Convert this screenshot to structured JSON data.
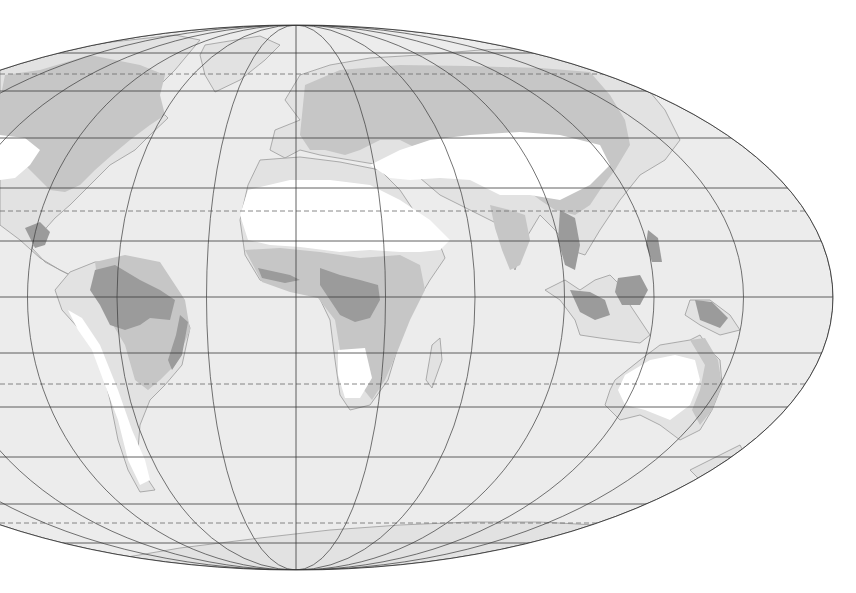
{
  "map": {
    "type": "world-biome-map",
    "projection": "elliptical (Hammer/Aitoff-like), central meridian ~15°E",
    "canvas": {
      "width": 856,
      "height": 593,
      "background": "#ffffff"
    },
    "ellipse": {
      "cx": 296,
      "cy": 297.5,
      "rx": 537,
      "ry": 272.5
    },
    "colors": {
      "ocean": "#ececec",
      "land": "#e2e2e2",
      "coast": "#9a9a9a",
      "forest": "#c6c6c6",
      "rainforest": "#9b9b9b",
      "desert": "#ffffff",
      "grid": "#3a3a3a",
      "dashed": "#6a6a6a"
    },
    "graticule": {
      "meridian_step_px": 89.5,
      "meridian_count_each_side": 6,
      "parallels_solid_y": [
        53,
        91,
        138,
        188,
        241,
        297,
        353,
        407,
        457,
        504,
        543
      ],
      "parallels_dashed_y": [
        74,
        211,
        384,
        523
      ],
      "parallel_labels": {
        "74": "Arctic Circle",
        "211": "Tropic of Cancer",
        "297": "Equator",
        "384": "Tropic of Capricorn",
        "523": "Antarctic Circle"
      }
    },
    "legend_classes": [
      "desert",
      "forest",
      "rainforest",
      "other land"
    ]
  },
  "regions": {
    "land": [
      {
        "name": "north-america",
        "d": "M0,60 L60,48 L130,40 L175,35 L200,40 L175,70 L150,95 L160,110 L168,118 L150,135 L135,150 L110,165 L95,180 L70,205 L55,218 L40,235 L32,248 L45,262 L60,270 L80,280 L60,270 L40,258 L20,240 L0,225 Z"
      },
      {
        "name": "greenland",
        "d": "M205,45 L260,36 L280,45 L265,60 L240,80 L215,92 L205,75 L200,55 Z"
      },
      {
        "name": "south-america",
        "d": "M70,272 L95,262 L118,262 L150,285 L180,300 L190,328 L182,365 L165,385 L150,400 L140,425 L138,450 L145,475 L155,490 L140,492 L128,470 L118,440 L110,400 L100,360 L80,330 L62,310 L55,290 Z"
      },
      {
        "name": "europe-asia",
        "d": "M300,120 L285,100 L300,75 L330,65 L370,58 L420,55 L480,50 L540,48 L600,60 L640,80 L665,110 L680,140 L665,160 L640,175 L620,200 L600,230 L585,255 L570,250 L555,230 L540,215 L525,240 L515,270 L505,250 L500,225 L480,215 L460,205 L440,195 L420,178 L400,170 L380,165 L350,160 L320,155 L300,150 L285,158 L270,150 L275,130 Z"
      },
      {
        "name": "africa",
        "d": "M260,160 L300,157 L340,162 L380,170 L400,190 L420,220 L440,245 L445,258 L430,280 L415,305 L400,340 L388,380 L370,405 L350,410 L340,395 L335,360 L330,320 L318,295 L290,290 L260,280 L245,255 L240,220 L248,185 Z"
      },
      {
        "name": "madagascar",
        "d": "M432,345 L440,338 L442,360 L432,388 L426,380 Z"
      },
      {
        "name": "southeast-asia-islands",
        "d": "M545,290 L560,300 L575,320 L580,335 L600,338 L615,340 L640,343 L650,335 L640,320 L630,305 L625,290 L610,275 L595,280 L580,290 L565,280 Z"
      },
      {
        "name": "new-guinea",
        "d": "M690,300 L710,300 L730,315 L740,330 L720,335 L700,325 L685,315 Z"
      },
      {
        "name": "australia",
        "d": "M615,380 L640,360 L660,345 L690,340 L700,335 L710,350 L720,360 L722,385 L712,410 L700,430 L680,440 L660,425 L640,415 L620,420 L605,405 L610,390 Z"
      },
      {
        "name": "new-zealand",
        "d": "M690,470 L720,455 L740,445 L745,455 L728,465 L700,480 Z"
      },
      {
        "name": "antarctica",
        "d": "M110,560 L180,548 L260,538 L330,530 L400,525 L470,522 L540,522 L595,525 L560,545 L470,562 L380,570 L300,572 L220,570 L160,566 Z"
      }
    ],
    "forest": [
      {
        "name": "north-america-boreal-temperate",
        "d": "M5,75 L40,70 L90,55 L140,65 L165,75 L160,95 L165,115 L150,125 L130,140 L112,155 L95,170 L80,185 L65,192 L50,190 L35,175 L20,160 L0,150 L0,100 Z"
      },
      {
        "name": "eurasia-forest",
        "d": "M305,85 L340,70 L400,65 L470,66 L540,68 L590,72 L610,95 L625,120 L630,145 L615,170 L600,190 L590,205 L575,215 L555,210 L540,200 L520,185 L500,175 L480,165 L460,160 L440,160 L420,150 L400,140 L380,140 L360,150 L345,155 L325,150 L310,150 L300,135 Z"
      },
      {
        "name": "africa-savanna",
        "d": "M245,250 L280,248 L320,252 L360,258 L400,255 L420,265 L425,290 L410,320 L398,350 L385,380 L372,400 L356,380 L340,350 L335,320 L318,298 L290,292 L262,282 Z"
      },
      {
        "name": "south-america-forest",
        "d": "M95,262 L125,255 L160,262 L185,300 L190,330 L175,365 L160,380 L148,390 L135,380 L125,345 L110,320 L100,300 Z"
      },
      {
        "name": "india-forest",
        "d": "M490,205 L510,210 L525,215 L530,240 L520,265 L510,270 L502,250 L495,228 Z"
      },
      {
        "name": "australia-rim-forest",
        "d": "M690,340 L705,338 L718,360 L722,385 L712,410 L700,425 L692,410 L700,390 L705,365 Z"
      }
    ],
    "rainforest": [
      {
        "name": "central-america-rainforest",
        "d": "M25,228 L40,222 L50,232 L45,245 L35,248 Z"
      },
      {
        "name": "amazon-rainforest",
        "d": "M95,270 L115,265 L140,280 L160,290 L175,300 L170,320 L150,318 L140,325 L125,330 L110,325 L100,305 L90,290 Z"
      },
      {
        "name": "brazil-coast-rainforest",
        "d": "M180,315 L188,322 L182,355 L172,370 L168,360 L176,335 Z"
      },
      {
        "name": "congo-rainforest",
        "d": "M320,268 L340,275 L360,280 L378,285 L380,300 L370,318 L355,322 L340,315 L330,300 L320,285 Z"
      },
      {
        "name": "west-africa-rainforest",
        "d": "M258,268 L290,275 L300,280 L285,283 L262,278 Z"
      },
      {
        "name": "southeast-asia-rainforest",
        "d": "M560,210 L575,218 L580,245 L575,270 L565,265 L558,240 Z"
      },
      {
        "name": "indonesia-rainforest",
        "d": "M570,290 L590,292 L605,300 L610,315 L595,320 L580,312 Z"
      },
      {
        "name": "borneo-rainforest",
        "d": "M618,278 L640,275 L648,290 L640,305 L622,305 L615,292 Z"
      },
      {
        "name": "new-guinea-rainforest",
        "d": "M695,300 L712,302 L728,318 L720,328 L700,320 Z"
      },
      {
        "name": "philippines-rainforest",
        "d": "M648,230 L658,238 L662,262 L652,262 L646,245 Z"
      }
    ],
    "desert": [
      {
        "name": "north-american-desert",
        "d": "M0,135 L25,138 L40,150 L30,165 L15,178 L0,180 Z"
      },
      {
        "name": "sahara-arabia",
        "d": "M248,190 L290,180 L330,180 L370,185 L400,200 L430,220 L450,240 L440,250 L420,252 L400,252 L370,250 L340,252 L300,247 L270,245 L248,240 L240,215 Z"
      },
      {
        "name": "central-asian-desert",
        "d": "M370,165 L400,150 L430,140 L470,135 L520,132 L560,135 L600,145 L610,165 L590,185 L560,200 L530,195 L500,195 L470,180 L440,178 L410,180 L390,178 Z"
      },
      {
        "name": "kalahari-namib",
        "d": "M338,350 L365,348 L372,378 L360,398 L345,398 L338,375 Z"
      },
      {
        "name": "atacama-patagonia",
        "d": "M68,310 L82,318 L100,345 L118,390 L132,430 L145,460 L150,480 L140,485 L128,460 L118,420 L105,385 L92,350 L78,330 Z"
      },
      {
        "name": "australian-desert",
        "d": "M625,375 L650,360 L675,355 L695,360 L700,380 L690,405 L670,420 L645,410 L625,405 L618,390 Z"
      }
    ]
  }
}
